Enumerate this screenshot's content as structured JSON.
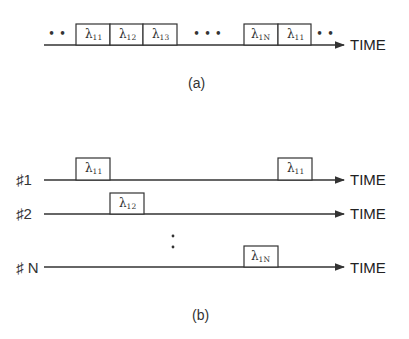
{
  "panel_a": {
    "caption": "(a)",
    "axis_label": "TIME",
    "leading_dots": "• •",
    "middle_dots": "•   •   •",
    "trailing_dots": "• •",
    "slots": [
      {
        "symbol": "λ",
        "sub": "11"
      },
      {
        "symbol": "λ",
        "sub": "12"
      },
      {
        "symbol": "λ",
        "sub": "13"
      },
      {
        "symbol": "λ",
        "sub": "1N"
      },
      {
        "symbol": "λ",
        "sub": "11"
      }
    ]
  },
  "panel_b": {
    "caption": "(b)",
    "rows": [
      {
        "label": "♯1",
        "axis_label": "TIME",
        "slots": [
          {
            "symbol": "λ",
            "sub": "11"
          },
          {
            "symbol": "λ",
            "sub": "11"
          }
        ]
      },
      {
        "label": "♯2",
        "axis_label": "TIME",
        "slots": [
          {
            "symbol": "λ",
            "sub": "12"
          }
        ]
      },
      {
        "label": "♯ N",
        "axis_label": "TIME",
        "slots": [
          {
            "symbol": "λ",
            "sub": "1N"
          }
        ]
      }
    ],
    "vertical_dots": ":"
  }
}
